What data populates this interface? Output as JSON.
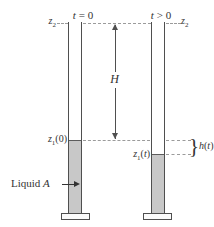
{
  "figure": {
    "labels": {
      "t_initial": {
        "var": "t",
        "rest": " = 0"
      },
      "t_later": {
        "var": "t",
        "rest": " > 0"
      },
      "z2_left": {
        "var": "z",
        "sub": "2"
      },
      "z2_right": {
        "var": "z",
        "sub": "2"
      },
      "z1_initial": {
        "var": "z",
        "sub": "1",
        "suffix": "(0)"
      },
      "z1_later": {
        "var": "z",
        "sub": "1",
        "open": "(",
        "arg": "t",
        "close": ")"
      },
      "height": "H",
      "h_t": {
        "var": "h",
        "open": "(",
        "arg": "t",
        "close": ")"
      },
      "liquid": {
        "text": "Liquid ",
        "var": "A"
      },
      "brace": "}"
    },
    "colors": {
      "liquid_fill": "#c8c8c8",
      "liquid_surface": "#5c5c5c",
      "tube_stroke": "#4f4f4f",
      "dash": "#9b9b9b",
      "text": "#333333",
      "base_fill": "#fbfbfb"
    }
  }
}
